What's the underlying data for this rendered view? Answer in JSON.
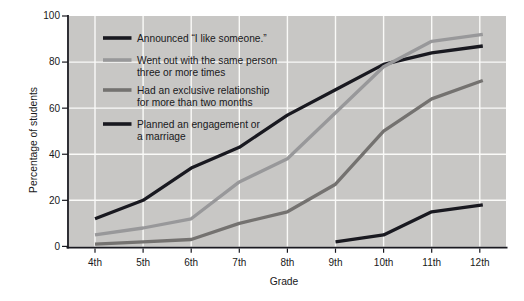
{
  "chart_data": {
    "type": "line",
    "title": "",
    "xlabel": "Grade",
    "ylabel": "Percentage of students",
    "categories": [
      "4th",
      "5th",
      "6th",
      "7th",
      "8th",
      "9th",
      "10th",
      "11th",
      "12th"
    ],
    "ylim": [
      0,
      100
    ],
    "yticks": [
      0,
      20,
      40,
      60,
      80,
      100
    ],
    "grid": true,
    "grid_color": "#fafaf8",
    "plot_bg": "#c8c7c5",
    "axis_color": "#191920",
    "legend_position": "top-left-inside",
    "series": [
      {
        "name": "announced",
        "label_lines": [
          "Announced “I like someone.”"
        ],
        "color": "#191920",
        "values": [
          12,
          20,
          34,
          43,
          57,
          68,
          79,
          84,
          87
        ]
      },
      {
        "name": "went-out",
        "label_lines": [
          "Went out with the same person",
          "three or more times"
        ],
        "color": "#98989a",
        "values": [
          5,
          8,
          12,
          28,
          38,
          58,
          78,
          89,
          92
        ]
      },
      {
        "name": "exclusive-relationship",
        "label_lines": [
          "Had an exclusive relationship",
          "for more than two months"
        ],
        "color": "#747270",
        "values": [
          1,
          2,
          3,
          10,
          15,
          27,
          50,
          64,
          72
        ]
      },
      {
        "name": "engagement",
        "label_lines": [
          "Planned an engagement or",
          "a marriage"
        ],
        "color": "#191920",
        "values": [
          null,
          null,
          null,
          null,
          null,
          2,
          5,
          15,
          18
        ]
      }
    ]
  }
}
